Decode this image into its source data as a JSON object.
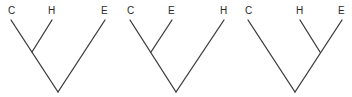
{
  "diagram": {
    "title": "",
    "trees": [
      {
        "id": "tree-1",
        "topology": "((C,H),E)",
        "labels": [
          "C",
          "H",
          "E"
        ],
        "leaves": [
          {
            "label": "C",
            "x": 11,
            "y": 14
          },
          {
            "label": "H",
            "x": 52,
            "y": 19
          },
          {
            "label": "E",
            "x": 105,
            "y": 19
          }
        ],
        "internal": {
          "x": 32,
          "y": 52
        },
        "root": {
          "x": 58,
          "y": 92
        }
      },
      {
        "id": "tree-2",
        "topology": "((C,E),H)",
        "labels": [
          "C",
          "E",
          "H"
        ],
        "leaves": [
          {
            "label": "C",
            "x": 130,
            "y": 19
          },
          {
            "label": "E",
            "x": 172,
            "y": 19
          },
          {
            "label": "H",
            "x": 224,
            "y": 19
          }
        ],
        "internal": {
          "x": 151,
          "y": 52
        },
        "root": {
          "x": 176,
          "y": 92
        }
      },
      {
        "id": "tree-3",
        "topology": "(C,(H,E))",
        "labels": [
          "C",
          "H",
          "E"
        ],
        "leaves": [
          {
            "label": "C",
            "x": 248,
            "y": 19
          },
          {
            "label": "H",
            "x": 300,
            "y": 19
          },
          {
            "label": "E",
            "x": 342,
            "y": 19
          }
        ],
        "internal": {
          "x": 320,
          "y": 52
        },
        "root": {
          "x": 295,
          "y": 92
        }
      }
    ],
    "colors": {
      "line": "#3a3a3a",
      "text": "#2a2a2a",
      "background": "#ffffff"
    }
  }
}
